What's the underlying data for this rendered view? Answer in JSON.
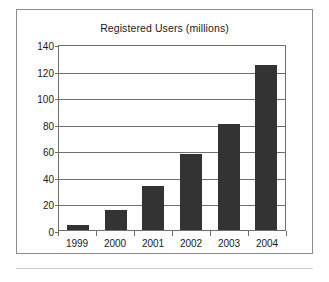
{
  "chart_data": {
    "type": "bar",
    "title": "Registered Users (millions)",
    "xlabel": "",
    "ylabel": "",
    "categories": [
      "1999",
      "2000",
      "2001",
      "2002",
      "2003",
      "2004"
    ],
    "values": [
      4,
      15,
      33,
      57,
      80,
      124
    ],
    "ylim": [
      0,
      140
    ],
    "ytick_step": 20,
    "yticks": [
      "140",
      "120",
      "100",
      "80",
      "60",
      "40",
      "20",
      "0"
    ],
    "grid": true,
    "legend": false,
    "legend_position": "none",
    "series": [
      {
        "name": "Registered Users (millions)",
        "values": [
          4,
          15,
          33,
          57,
          80,
          124
        ]
      }
    ],
    "colors": {
      "bar": "#333333",
      "gridline": "#707070",
      "axis": "#6e6e6e",
      "frame": "#8c8c8c",
      "text": "#1a1a1a",
      "background": "#ffffff"
    }
  }
}
